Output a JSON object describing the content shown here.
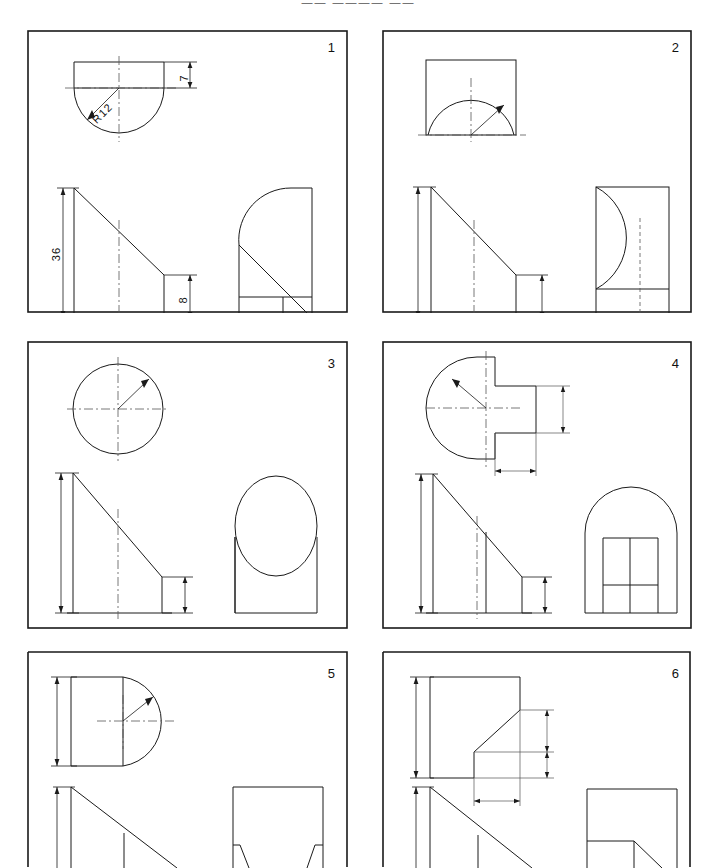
{
  "sheet": {
    "header": "—— ———— ——",
    "width": 717,
    "height": 868,
    "line_color": "#1a1a1a",
    "background": "#ffffff",
    "title": "Orthographic Projection Exercise Sheet"
  },
  "panels": [
    {
      "number": "1",
      "x": 27,
      "y": 30,
      "w": 321,
      "h": 283,
      "description": "Quarter-round wedge: top view semicircular with flat top, front view right triangle, side view arc with step",
      "dimensions": [
        {
          "label": "7",
          "orientation": "vertical",
          "x": 168,
          "y": 72
        },
        {
          "label": "R12",
          "orientation": "diagonal",
          "x": 88,
          "y": 98
        },
        {
          "label": "36",
          "orientation": "vertical",
          "x": 48,
          "y": 230
        },
        {
          "label": "8",
          "orientation": "vertical",
          "x": 172,
          "y": 272
        }
      ]
    },
    {
      "number": "2",
      "x": 382,
      "y": 30,
      "w": 310,
      "h": 283,
      "description": "Top view square with inscribed semicircular dome, front view right triangle, side view rectangle with bulged arc and hidden centre line",
      "dimensions": []
    },
    {
      "number": "3",
      "x": 27,
      "y": 341,
      "w": 321,
      "h": 288,
      "description": "Top view full circle with crosshair centre lines and radius arrow, front view right triangle, side view rectangle with inscribed ellipse",
      "dimensions": []
    },
    {
      "number": "4",
      "x": 382,
      "y": 341,
      "w": 310,
      "h": 288,
      "description": "Top view semicircle with stepped rectangular tab, front view triangle with vertical rib line, side view arch with H slot",
      "dimensions": []
    },
    {
      "number": "5",
      "x": 27,
      "y": 651,
      "w": 321,
      "h": 217,
      "description": "Top view rectangle with semicircular bulge to the right, front view right triangle, side view rectangle with tapered feet",
      "dimensions": []
    },
    {
      "number": "6",
      "x": 382,
      "y": 651,
      "w": 310,
      "h": 217,
      "description": "Top view rectangle with chamfered corner notch, front view right triangle with step, side view rectangle with angled cut",
      "dimensions": []
    }
  ]
}
